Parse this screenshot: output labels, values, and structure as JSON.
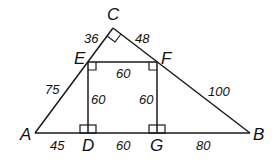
{
  "diagram": {
    "title": "",
    "points": {
      "A": {
        "label": "A",
        "x": 35,
        "y": 133
      },
      "B": {
        "label": "B",
        "x": 250,
        "y": 133
      },
      "C": {
        "label": "C",
        "x": 113,
        "y": 28
      },
      "D": {
        "label": "D",
        "x": 88,
        "y": 133
      },
      "E": {
        "label": "E",
        "x": 88,
        "y": 62
      },
      "F": {
        "label": "F",
        "x": 157,
        "y": 62
      },
      "G": {
        "label": "G",
        "x": 157,
        "y": 133
      }
    },
    "labels": {
      "A": "A",
      "B": "B",
      "C": "C",
      "D": "D",
      "E": "E",
      "F": "F",
      "G": "G"
    },
    "lengths": {
      "CE": "36",
      "CF": "48",
      "EF": "60",
      "AE": "75",
      "FB": "100",
      "ED": "60",
      "FG": "60",
      "AD": "45",
      "DG": "60",
      "GB": "80"
    },
    "right_angles": [
      "C",
      "E",
      "F",
      "D",
      "G"
    ]
  }
}
